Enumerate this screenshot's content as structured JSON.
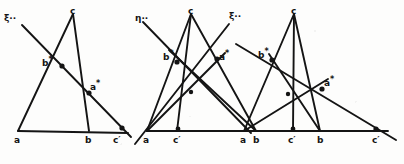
{
  "page": {
    "background_color": "#fdfdfc",
    "ink_color": "#141414",
    "figure_count": 3
  },
  "figures": [
    {
      "id": "figure-1",
      "caption": "",
      "line_label": "ξ",
      "line_label_marks": "··",
      "line_label_full": "ξ··",
      "vertices": [
        {
          "name": "a",
          "label": "a",
          "x": 18,
          "y": 131
        },
        {
          "name": "b",
          "label": "b",
          "x": 89,
          "y": 131
        },
        {
          "name": "c",
          "label": "c",
          "x": 73,
          "y": 14
        }
      ],
      "marked_points": [
        {
          "name": "b-star",
          "label": "b",
          "mark": "*",
          "x": 57,
          "y": 60
        },
        {
          "name": "a-star",
          "label": "a",
          "mark": "*",
          "x": 84,
          "y": 85
        },
        {
          "name": "c-prime",
          "label": "c",
          "mark": "′",
          "x": 117,
          "y": 131
        }
      ]
    },
    {
      "id": "figure-2",
      "caption": "",
      "line_label_left": "η",
      "line_label_left_marks": "··",
      "line_label_left_full": "η··",
      "line_label_right": "ξ",
      "line_label_right_marks": "··",
      "line_label_right_full": "ξ··",
      "vertices": [
        {
          "name": "a",
          "label": "a",
          "x": 14,
          "y": 131
        },
        {
          "name": "b",
          "label": "b",
          "x": 123,
          "y": 131
        },
        {
          "name": "c",
          "label": "c",
          "x": 58,
          "y": 14
        }
      ],
      "marked_points": [
        {
          "name": "b-star",
          "label": "b",
          "mark": "*",
          "x": 39,
          "y": 57
        },
        {
          "name": "a-star",
          "label": "a",
          "mark": "*",
          "x": 76,
          "y": 57
        },
        {
          "name": "c-prime",
          "label": "c",
          "mark": "′",
          "x": 44,
          "y": 131
        }
      ]
    },
    {
      "id": "figure-3",
      "caption": "",
      "line_label": "",
      "vertices": [
        {
          "name": "a",
          "label": "a",
          "x": 8,
          "y": 131
        },
        {
          "name": "b",
          "label": "b",
          "x": 84,
          "y": 131
        },
        {
          "name": "c",
          "label": "c",
          "x": 58,
          "y": 14
        }
      ],
      "marked_points": [
        {
          "name": "b-star",
          "label": "b",
          "mark": "*",
          "x": 32,
          "y": 53
        },
        {
          "name": "a-star",
          "label": "a",
          "mark": "*",
          "x": 82,
          "y": 85
        },
        {
          "name": "c-prime-1",
          "label": "c",
          "mark": "′",
          "x": 56,
          "y": 131
        },
        {
          "name": "c-prime-2",
          "label": "c",
          "mark": "′",
          "x": 140,
          "y": 131
        }
      ]
    }
  ]
}
